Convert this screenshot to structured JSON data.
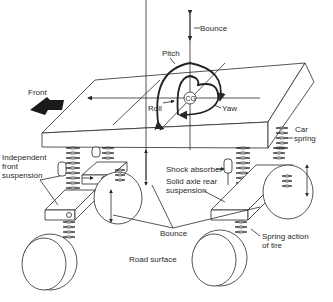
{
  "diagram": {
    "labels": {
      "bounce_top": "Bounce",
      "pitch": "Pitch",
      "roll": "Roll",
      "yaw": "Yaw",
      "cg": "CG",
      "front": "Front",
      "car_spring_1": "Car",
      "car_spring_2": "spring",
      "ind_front_1": "Independent",
      "ind_front_2": "front",
      "ind_front_3": "suspension",
      "shock_absorber": "Shock absorber",
      "solid_axle_1": "Solid axle rear",
      "solid_axle_2": "suspension",
      "bounce_bottom": "Bounce",
      "road_surface": "Road surface",
      "spring_tire_1": "Spring action",
      "spring_tire_2": "of tire"
    },
    "colors": {
      "line": "#2a2a2a",
      "background": "#ffffff",
      "arrow_fill": "#1a1a1a"
    }
  }
}
